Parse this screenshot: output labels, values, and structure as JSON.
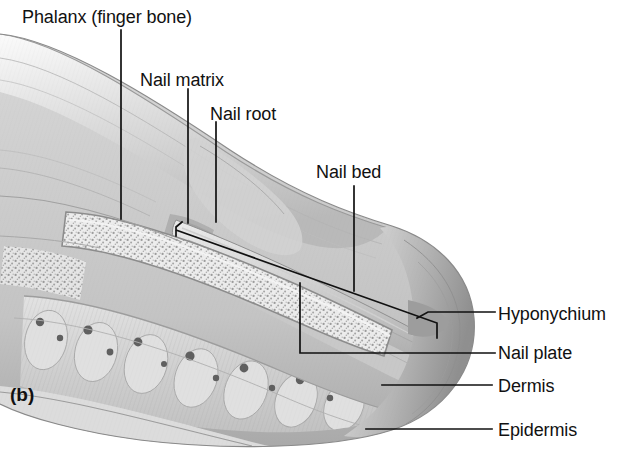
{
  "figure": {
    "panel_label": "(b)",
    "background_color": "#ffffff",
    "ink_color": "#111111"
  },
  "labels": [
    {
      "id": "phalanx",
      "text": "Phalanx (finger bone)",
      "x": 22,
      "y": 8,
      "anchor": "left"
    },
    {
      "id": "nail-matrix",
      "text": "Nail matrix",
      "x": 140,
      "y": 71,
      "anchor": "left"
    },
    {
      "id": "nail-root",
      "text": "Nail root",
      "x": 210,
      "y": 105,
      "anchor": "left"
    },
    {
      "id": "nail-bed",
      "text": "Nail bed",
      "x": 316,
      "y": 163,
      "anchor": "left"
    },
    {
      "id": "hyponychium",
      "text": "Hyponychium",
      "x": 498,
      "y": 305,
      "anchor": "left"
    },
    {
      "id": "nail-plate",
      "text": "Nail plate",
      "x": 498,
      "y": 344,
      "anchor": "left"
    },
    {
      "id": "dermis",
      "text": "Dermis",
      "x": 498,
      "y": 377,
      "anchor": "left"
    },
    {
      "id": "epidermis",
      "text": "Epidermis",
      "x": 498,
      "y": 421,
      "anchor": "left"
    }
  ],
  "leaders": [
    {
      "id": "phalanx-leader",
      "for": "phalanx",
      "path": "M121,30 L121,219"
    },
    {
      "id": "nail-matrix-leader",
      "for": "nail-matrix",
      "path": "M188,89 L188,223"
    },
    {
      "id": "nail-root-leader",
      "for": "nail-root",
      "path": "M216,122 L216,222"
    },
    {
      "id": "nail-bed-leader",
      "for": "nail-bed",
      "path": "M354,186 L354,291"
    },
    {
      "id": "nail-plate-bracket",
      "for": "nail-plate",
      "path": "M182,222 L176,227 L176,236 M176,230 L437,323 L437,338 M300,283 L300,353 L495,353"
    },
    {
      "id": "hyponychium-leader",
      "for": "hyponychium",
      "path": "M495,312 L428,312 L417,318"
    },
    {
      "id": "dermis-leader",
      "for": "dermis",
      "path": "M382,385 L492,385"
    },
    {
      "id": "epidermis-leader",
      "for": "epidermis",
      "path": "M366,429 L492,429"
    }
  ],
  "anatomy_parts": [
    {
      "id": "epidermis-layer",
      "name": "Epidermis",
      "tone": "#d8d8d8"
    },
    {
      "id": "dermis-layer",
      "name": "Dermis",
      "tone": "#c9c9c9"
    },
    {
      "id": "phalanx-bone",
      "name": "Phalanx (finger bone)",
      "tone": "#e3e3e3"
    },
    {
      "id": "nail-plate-body",
      "name": "Nail plate",
      "tone": "#f2f2f2"
    },
    {
      "id": "nail-bed-tissue",
      "name": "Nail bed",
      "tone": "#cfcfcf"
    },
    {
      "id": "nail-matrix-zone",
      "name": "Nail matrix",
      "tone": "#bdbdbd"
    },
    {
      "id": "nail-root-zone",
      "name": "Nail root",
      "tone": "#c5c5c5"
    },
    {
      "id": "hyponychium-zone",
      "name": "Hyponychium",
      "tone": "#b4b4b4"
    }
  ]
}
